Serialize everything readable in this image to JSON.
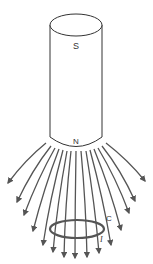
{
  "diagram": {
    "magnet": {
      "top_label": "S",
      "bottom_label": "N",
      "stroke_color": "#333333"
    },
    "loop": {
      "label": "C",
      "current_label": "I",
      "stroke_color": "#555555"
    },
    "field_lines": {
      "count": 15,
      "color": "#555555",
      "direction": "away from N pole, downward"
    }
  }
}
